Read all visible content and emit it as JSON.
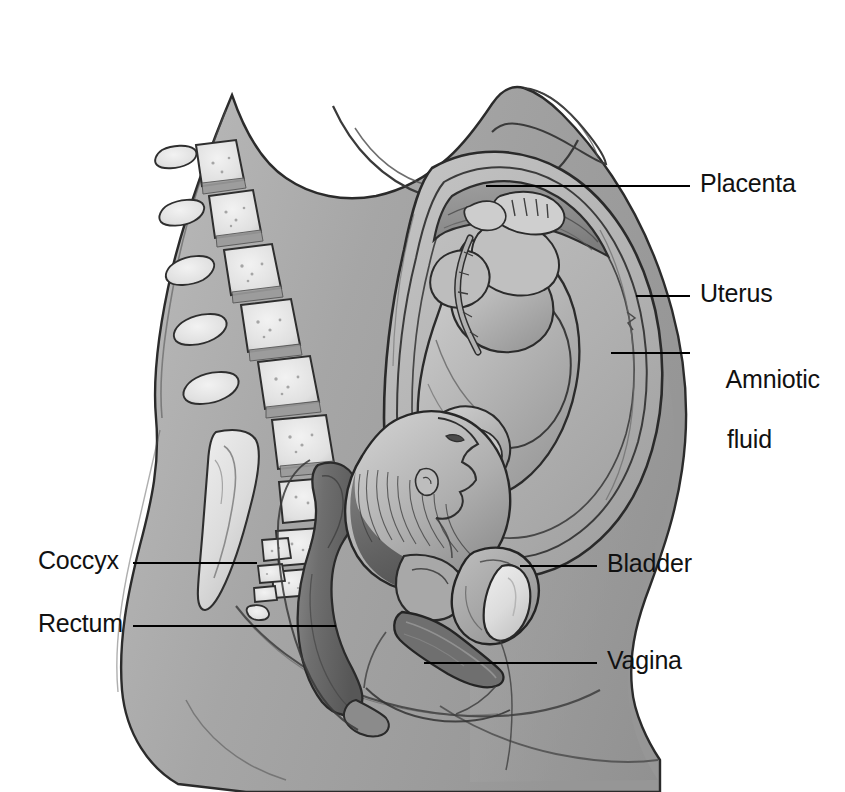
{
  "figure": {
    "background_color": "#ffffff",
    "width": 845,
    "height": 792,
    "line_color": "#000000",
    "ink_color": "#3a3a3a",
    "skin_fill": "#a9a9a9",
    "bone_fill": "#e4e4e4",
    "dark_tissue_fill": "#6d6d6d",
    "amniotic_fill": "#b4b4b4"
  },
  "labels": [
    {
      "id": "placenta",
      "text": "Placenta",
      "side": "right",
      "text_x": 700,
      "text_y": 168,
      "leader": {
        "x1": 486,
        "y1": 186,
        "x2": 690,
        "y2": 186
      }
    },
    {
      "id": "uterus",
      "text": "Uterus",
      "side": "right",
      "text_x": 700,
      "text_y": 278,
      "leader": {
        "x1": 636,
        "y1": 296,
        "x2": 690,
        "y2": 296
      }
    },
    {
      "id": "amniotic-fluid",
      "text": "Amniotic\nfluid",
      "line1": "Amniotic",
      "line2": "fluid",
      "side": "right",
      "text_x": 700,
      "text_y": 334,
      "leader": {
        "x1": 611,
        "y1": 353,
        "x2": 690,
        "y2": 353
      }
    },
    {
      "id": "bladder",
      "text": "Bladder",
      "side": "right",
      "text_x": 607,
      "text_y": 548,
      "leader": {
        "x1": 520,
        "y1": 566,
        "x2": 597,
        "y2": 566
      }
    },
    {
      "id": "vagina",
      "text": "Vagina",
      "side": "right",
      "text_x": 607,
      "text_y": 645,
      "leader": {
        "x1": 424,
        "y1": 663,
        "x2": 597,
        "y2": 663
      }
    },
    {
      "id": "coccyx",
      "text": "Coccyx",
      "side": "left",
      "text_x": 38,
      "text_y": 545,
      "leader": {
        "x1": 133,
        "y1": 563,
        "x2": 257,
        "y2": 563
      }
    },
    {
      "id": "rectum",
      "text": "Rectum",
      "side": "left",
      "text_x": 38,
      "text_y": 608,
      "leader": {
        "x1": 133,
        "y1": 626,
        "x2": 336,
        "y2": 626
      }
    }
  ],
  "anatomy_parts": [
    {
      "id": "maternal-torso",
      "name": "Maternal torso silhouette"
    },
    {
      "id": "breast",
      "name": "Breast"
    },
    {
      "id": "vertebral-column",
      "name": "Vertebral column"
    },
    {
      "id": "sacrum",
      "name": "Sacrum"
    },
    {
      "id": "coccyx-bone",
      "name": "Coccyx"
    },
    {
      "id": "uterus-wall",
      "name": "Uterine wall"
    },
    {
      "id": "amniotic-sac",
      "name": "Amniotic sac"
    },
    {
      "id": "placenta-mass",
      "name": "Placenta"
    },
    {
      "id": "fetus",
      "name": "Fetus in vertex presentation"
    },
    {
      "id": "umbilical-cord",
      "name": "Umbilical cord"
    },
    {
      "id": "bladder-organ",
      "name": "Urinary bladder"
    },
    {
      "id": "pubic-symphysis",
      "name": "Pubic symphysis"
    },
    {
      "id": "cervix",
      "name": "Cervix"
    },
    {
      "id": "vaginal-canal",
      "name": "Vaginal canal"
    },
    {
      "id": "rectum-organ",
      "name": "Rectum"
    },
    {
      "id": "anus",
      "name": "Anal canal"
    }
  ],
  "artifact": {
    "text": "",
    "x": 700,
    "y": 78
  }
}
